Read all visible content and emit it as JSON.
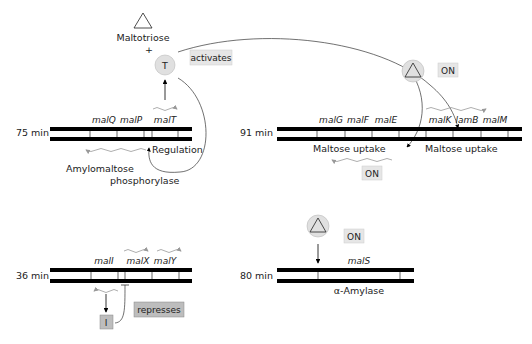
{
  "inducer": {
    "label": "Maltotriose",
    "plus": "+"
  },
  "activator": {
    "symbol": "T",
    "action_label": "activates"
  },
  "repressor": {
    "symbol": "I",
    "action_label": "represses"
  },
  "on_label": "ON",
  "loci": [
    {
      "id": "75min",
      "position": "75 min",
      "genes": [
        "malQ",
        "malP",
        "malT"
      ],
      "labels": [
        "Regulation",
        "Amylomaltose",
        "phosphorylase"
      ]
    },
    {
      "id": "91min",
      "position": "91 min",
      "genes": [
        "malG",
        "malF",
        "malE",
        "malK",
        "lamB",
        "malM"
      ],
      "labels": [
        "Maltose uptake",
        "Maltose uptake"
      ]
    },
    {
      "id": "36min",
      "position": "36 min",
      "genes": [
        "malI",
        "malX",
        "malY"
      ],
      "labels": []
    },
    {
      "id": "80min",
      "position": "80 min",
      "genes": [
        "malS"
      ],
      "labels": [
        "α-Amylase"
      ]
    }
  ],
  "colors": {
    "dna": "#000000",
    "mrna": "#999999",
    "box_fill": "#e6e6e6",
    "repress_fill": "#bdbdbd",
    "circle_fill": "#e0e0e0"
  }
}
